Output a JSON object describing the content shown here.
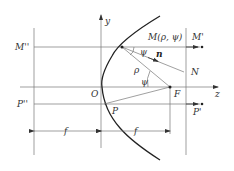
{
  "diagram": {
    "type": "parabolic-reflector-geometry",
    "axes": {
      "vertical": "y",
      "horizontal": "z"
    },
    "points": {
      "M": "M(ρ, ψ)",
      "M_prime": "M'",
      "M_double": "M''",
      "N": "N",
      "O": "O",
      "F": "F",
      "P": "P",
      "P_prime": "P'",
      "P_double": "P''"
    },
    "vector": "n",
    "radius": "ρ",
    "angle": "ψ",
    "dimensions": {
      "left": "f",
      "right": "f"
    }
  }
}
